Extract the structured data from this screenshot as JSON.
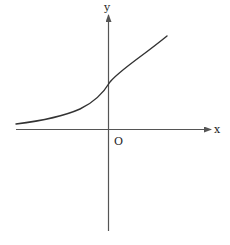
{
  "figure": {
    "axes": {
      "x_label": "x",
      "y_label": "y",
      "origin_label": "O"
    },
    "colors": {
      "axis": "#555555",
      "curve": "#333333",
      "text": "#222222",
      "background": "#ffffff"
    },
    "curve": {
      "type": "increasing-exponential",
      "asymptote": "approaches x-axis from above as x decreases",
      "y_intercept": "positive (above origin)"
    }
  }
}
